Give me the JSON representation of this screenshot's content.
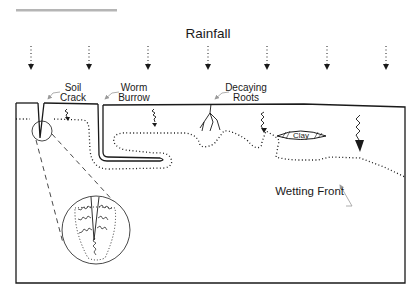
{
  "header_bar": {
    "color": "#b5b5b5"
  },
  "title": "Rainfall",
  "rain_arrows": {
    "count": 7
  },
  "labels": {
    "soil_crack_line1": "Soil",
    "soil_crack_line2": "Crack",
    "worm_burrow_line1": "Worm",
    "worm_burrow_line2": "Burrow",
    "decaying_roots_line1": "Decaying",
    "decaying_roots_line2": "Roots",
    "clay": "Clay",
    "wetting_front": "Wetting Front"
  },
  "colors": {
    "line": "#1a1a1a",
    "leader": "#9a9a9a",
    "background": "#ffffff"
  }
}
